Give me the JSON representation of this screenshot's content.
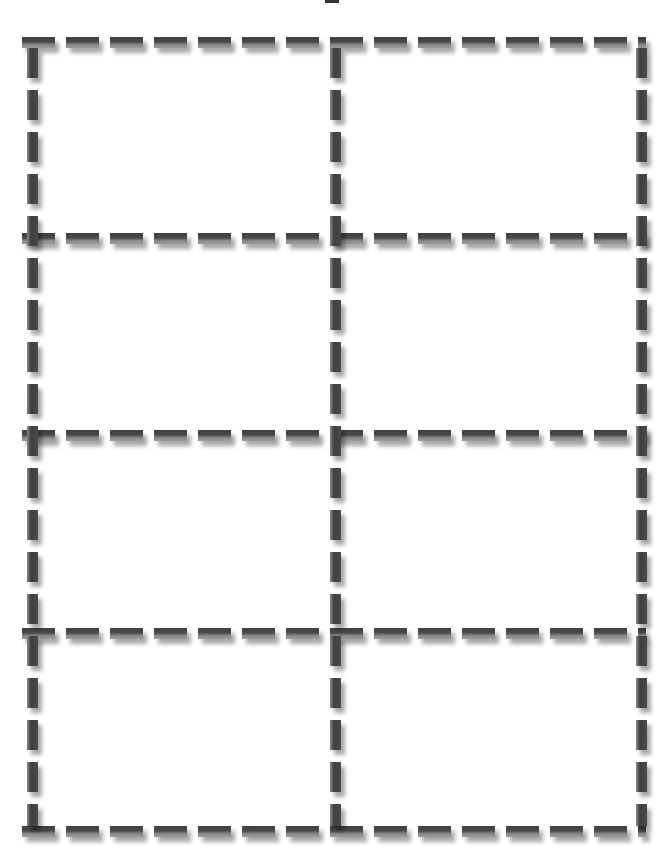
{
  "template": {
    "title": "Dashed grid cut-out template",
    "columns": 2,
    "rows": 4,
    "cell_count": 8,
    "line_style": "dashed-3d",
    "colors": {
      "dash": "#444444",
      "dash_highlight": "#8a8a8a",
      "shadow": "#bbbbbb",
      "background": "#ffffff"
    }
  },
  "cells": [
    {
      "row": 1,
      "col": 1,
      "label": ""
    },
    {
      "row": 1,
      "col": 2,
      "label": ""
    },
    {
      "row": 2,
      "col": 1,
      "label": ""
    },
    {
      "row": 2,
      "col": 2,
      "label": ""
    },
    {
      "row": 3,
      "col": 1,
      "label": ""
    },
    {
      "row": 3,
      "col": 2,
      "label": ""
    },
    {
      "row": 4,
      "col": 1,
      "label": ""
    },
    {
      "row": 4,
      "col": 2,
      "label": ""
    }
  ]
}
